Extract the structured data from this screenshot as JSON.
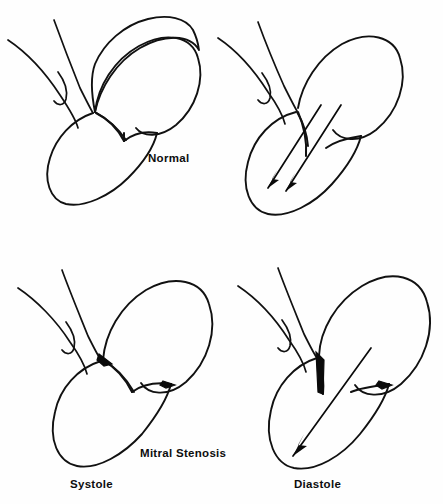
{
  "figure": {
    "background_color": "#fefefe",
    "ink_color": "#111111",
    "panel_count": 4
  },
  "labels": {
    "normal": "Normal",
    "mitral_stenosis": "Mitral Stenosis",
    "systole": "Systole",
    "diastole": "Diastole"
  },
  "panels": [
    {
      "id": "top-left",
      "condition": "Normal",
      "phase": "Systole",
      "valve_state": "closed",
      "leaflets_thickened": false,
      "arrow_count": 0
    },
    {
      "id": "top-right",
      "condition": "Normal",
      "phase": "Diastole",
      "valve_state": "open",
      "leaflets_thickened": false,
      "arrow_count": 2
    },
    {
      "id": "bottom-left",
      "condition": "Mitral Stenosis",
      "phase": "Systole",
      "valve_state": "closed",
      "leaflets_thickened": true,
      "arrow_count": 0
    },
    {
      "id": "bottom-right",
      "condition": "Mitral Stenosis",
      "phase": "Diastole",
      "valve_state": "narrowed-open",
      "leaflets_thickened": true,
      "arrow_count": 1
    }
  ]
}
